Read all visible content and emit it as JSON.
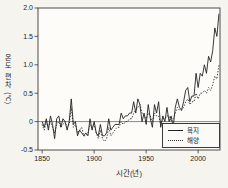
{
  "figure": {
    "background": "#f6f4ef",
    "plot_background": "#fdfcf8",
    "axis_color": "#3a3a3a",
    "line_color": "#222222"
  },
  "chart_data": {
    "type": "line",
    "title": "",
    "xlabel": "시간(년)",
    "ylabel": "온도 편차(℃)",
    "xlim": [
      1846,
      2021
    ],
    "ylim": [
      -0.5,
      2.0
    ],
    "x_ticks": [
      1850,
      1900,
      1950,
      2000
    ],
    "y_ticks": [
      2.0,
      1.5,
      1.0,
      0.5,
      0,
      -0.5
    ],
    "y_tick_labels": [
      "2.0",
      "1.5",
      "1.0",
      "0.5",
      "0",
      "-0.5"
    ],
    "grid": "zero-baseline-only",
    "legend_position": "lower right",
    "x_years": {
      "start": 1850,
      "end": 2020,
      "step": 2
    },
    "series": [
      {
        "name": "육지",
        "line_style": "solid",
        "values": [
          0,
          -0.1,
          0.05,
          -0.15,
          0.1,
          -0.05,
          -0.3,
          0.05,
          0.1,
          -0.1,
          0.05,
          0,
          -0.15,
          0,
          0.4,
          -0.05,
          0,
          -0.25,
          -0.15,
          -0.2,
          -0.25,
          -0.2,
          -0.25,
          0.05,
          -0.15,
          0,
          -0.2,
          -0.25,
          -0.05,
          -0.25,
          -0.25,
          -0.2,
          0.05,
          -0.15,
          -0.1,
          -0.05,
          -0.05,
          -0.05,
          0.15,
          0.05,
          0.1,
          0.1,
          0.15,
          0.15,
          0.35,
          0.15,
          0.4,
          0.3,
          0,
          0.15,
          -0.05,
          0.3,
          0.05,
          -0.1,
          0.3,
          0.15,
          0.35,
          -0.1,
          0.1,
          0,
          0.25,
          0,
          0.1,
          -0.1,
          0.25,
          0.4,
          0.25,
          0.2,
          0.35,
          0.55,
          0.6,
          0.35,
          0.45,
          0.45,
          0.85,
          0.6,
          0.85,
          0.8,
          1,
          0.85,
          1.15,
          1.05,
          1.25,
          1.65,
          1.5,
          1.9
        ]
      },
      {
        "name": "해양",
        "line_style": "dotted",
        "values": [
          -0.05,
          -0.15,
          0,
          -0.1,
          0,
          -0.1,
          -0.2,
          -0.05,
          0,
          -0.1,
          -0.05,
          0,
          -0.1,
          -0.05,
          0.25,
          -0.1,
          -0.05,
          -0.2,
          -0.15,
          -0.1,
          -0.25,
          -0.25,
          -0.2,
          -0.05,
          -0.1,
          -0.05,
          -0.2,
          -0.3,
          -0.15,
          -0.3,
          -0.35,
          -0.3,
          -0.1,
          -0.25,
          -0.2,
          -0.15,
          -0.1,
          -0.1,
          0,
          -0.05,
          0,
          0,
          0.05,
          0.05,
          0.15,
          0.2,
          0.25,
          0.3,
          0.15,
          0.1,
          0.05,
          0.15,
          0.1,
          0,
          0.15,
          0.1,
          0.1,
          -0.05,
          0.05,
          0.05,
          0.1,
          0.1,
          0,
          0.05,
          0.15,
          0.25,
          0.2,
          0.2,
          0.25,
          0.35,
          0.4,
          0.3,
          0.35,
          0.35,
          0.5,
          0.4,
          0.5,
          0.5,
          0.55,
          0.5,
          0.6,
          0.55,
          0.65,
          0.8,
          0.75,
          1
        ]
      }
    ]
  }
}
